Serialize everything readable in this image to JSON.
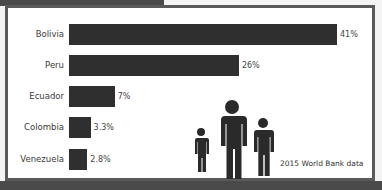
{
  "chart_data": {
    "type": "bar",
    "orientation": "horizontal",
    "title": "",
    "categories": [
      "Bolivia",
      "Peru",
      "Ecuador",
      "Colombia",
      "Venezuela"
    ],
    "values": [
      41,
      26,
      7,
      3.3,
      2.8
    ],
    "value_labels": [
      "41%",
      "26%",
      "7%",
      "3.3%",
      "2.8%"
    ],
    "xlabel": "",
    "ylabel": "",
    "xlim": [
      0,
      41
    ],
    "grid": false,
    "legend": null,
    "annotations": [
      "2015 World Bank data"
    ],
    "bar_color": "#2f2f2f"
  },
  "source_note": "2015 World Bank data",
  "decoration": {
    "people_icon_count": 3
  }
}
